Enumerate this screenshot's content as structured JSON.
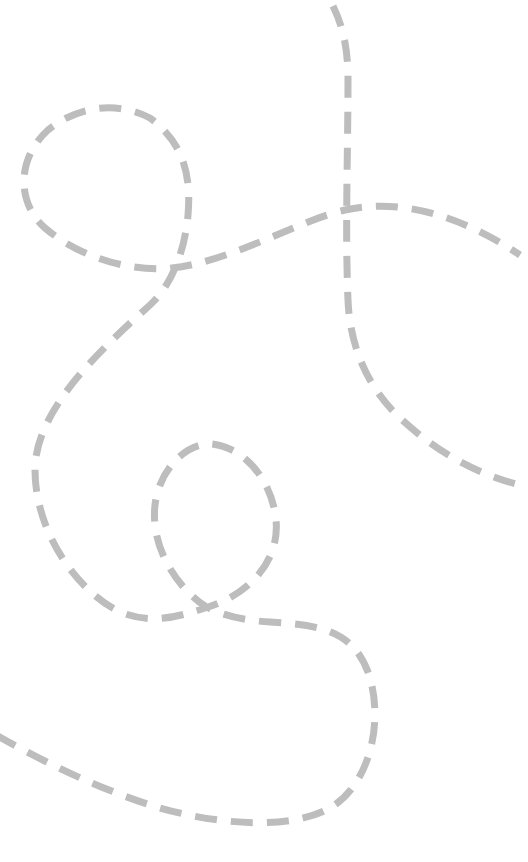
{
  "canvas": {
    "width": 528,
    "height": 862,
    "background": "#ffffff"
  },
  "style": {
    "stroke_color": "#bdbdbd",
    "stroke_width": 7,
    "dash_pattern": "22 14"
  },
  "paths": [
    {
      "name": "looping-curve",
      "d": "M -4 735 C 40 760, 100 790, 160 808 C 220 825, 290 830, 330 808 C 370 785, 385 720, 368 672 C 352 630, 320 625, 270 622 C 235 620, 215 612, 205 606 C 180 590, 150 550, 155 505 C 160 465, 190 442, 212 444 C 245 448, 272 480, 276 520 C 280 560, 250 595, 205 608 C 175 618, 150 624, 120 612 C 75 590, 35 530, 35 470 C 35 410, 100 350, 150 305 C 172 285, 185 250, 188 215 C 192 170, 180 140, 150 118 C 120 102, 80 104, 48 130 C 15 160, 18 205, 45 228 C 85 262, 140 272, 172 268 C 230 262, 300 220, 345 210 C 400 198, 460 215, 520 255"
    },
    {
      "name": "vertical-curve",
      "d": "M 333 6 C 342 25, 348 45, 348 80 C 348 150, 345 230, 348 300 C 350 350, 370 390, 400 418 C 440 455, 480 475, 520 485"
    }
  ]
}
